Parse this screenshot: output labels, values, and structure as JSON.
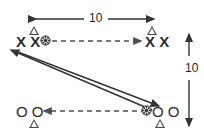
{
  "diagram": {
    "background_color": "#ffffff",
    "stroke_color": "#333333",
    "text_color": "#1f1f1f",
    "dimensions": [
      {
        "id": "horizontal",
        "label": "10",
        "orientation": "horizontal",
        "arrow_style": "double-headed"
      },
      {
        "id": "vertical",
        "label": "10",
        "orientation": "vertical",
        "arrow_style": "double-headed"
      }
    ],
    "groups": [
      {
        "id": "top-left",
        "players": "X X",
        "player_symbol": "X",
        "player_count": 2,
        "has_ball": true,
        "has_cone": true
      },
      {
        "id": "top-right",
        "players": "X X",
        "player_symbol": "X",
        "player_count": 2,
        "has_ball": false,
        "has_cone": true
      },
      {
        "id": "bottom-left",
        "players": "O O",
        "player_symbol": "O",
        "player_count": 2,
        "has_ball": false,
        "has_cone": true
      },
      {
        "id": "bottom-right",
        "players": "O O",
        "player_symbol": "O",
        "player_count": 2,
        "has_ball": true,
        "has_cone": true
      }
    ],
    "paths": [
      {
        "id": "ball-pass-top",
        "style": "dashed",
        "direction": "left-to-right",
        "from": "top-left",
        "to": "top-right"
      },
      {
        "id": "ball-pass-bottom",
        "style": "dashed",
        "direction": "right-to-left",
        "from": "bottom-right",
        "to": "bottom-left"
      },
      {
        "id": "player-run-down",
        "style": "solid",
        "direction": "top-left-to-bottom-right",
        "from": "top-left",
        "to": "bottom-right"
      },
      {
        "id": "player-run-up",
        "style": "solid",
        "direction": "bottom-right-to-top-left",
        "from": "bottom-right",
        "to": "top-left"
      }
    ],
    "ball_icon": "ball-icon",
    "cone_icon": "cone-icon"
  }
}
